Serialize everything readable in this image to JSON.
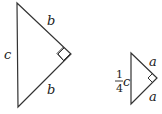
{
  "diagram": {
    "large_triangle": {
      "hypotenuse_label": "c",
      "leg_top_label": "b",
      "leg_bottom_label": "b",
      "right_angle": true
    },
    "small_triangle": {
      "hypotenuse_label_numerator": "1",
      "hypotenuse_label_denominator": "4",
      "hypotenuse_label_var": "c",
      "leg_top_label": "a",
      "leg_bottom_label": "a",
      "right_angle": true
    }
  }
}
